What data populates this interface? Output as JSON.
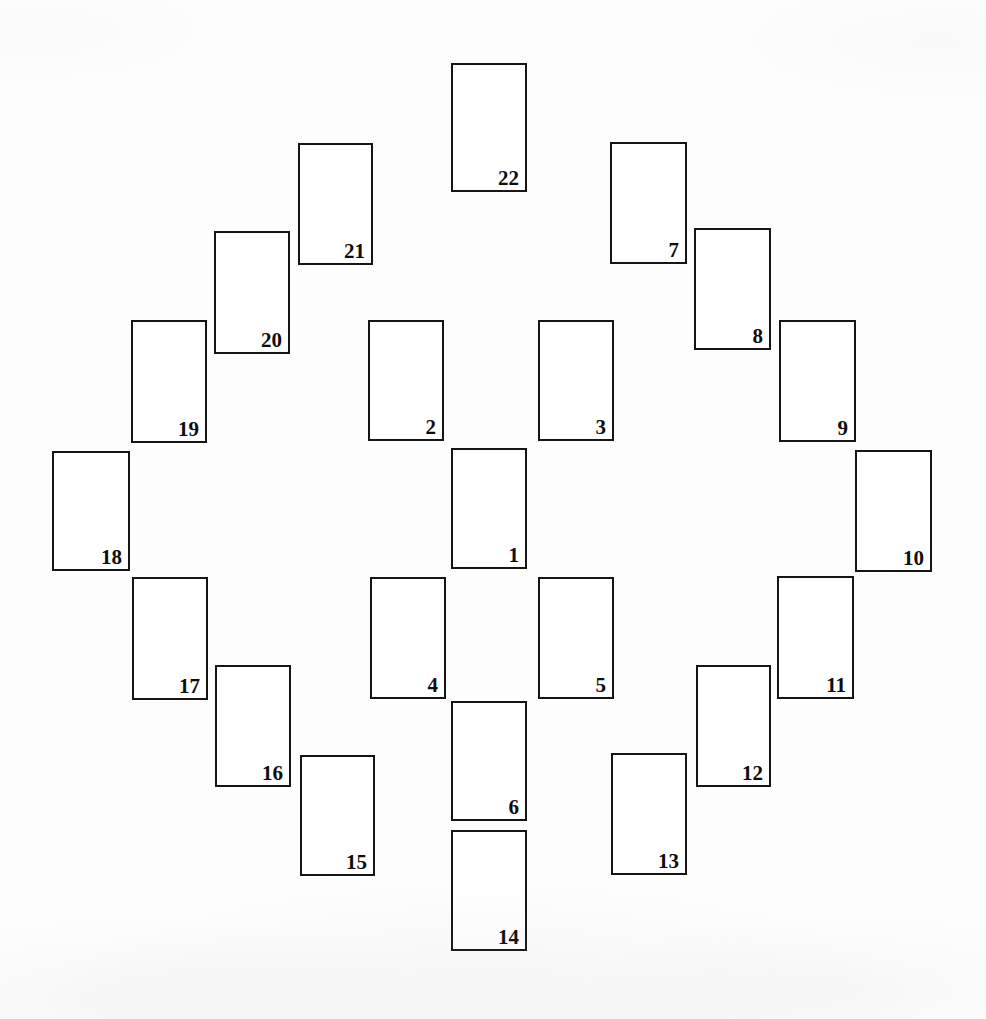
{
  "figure": {
    "type": "rectangle-arrangement-diagram",
    "background_color": "#fdfdfd",
    "stroke_color": "#151515",
    "label_color": "#0d0d0d",
    "canvas": {
      "width": 986,
      "height": 1019
    },
    "card_count": 22
  },
  "cards": [
    {
      "label": "1",
      "x": 451,
      "y": 448,
      "w": 76,
      "h": 121
    },
    {
      "label": "2",
      "x": 368,
      "y": 320,
      "w": 76,
      "h": 121
    },
    {
      "label": "3",
      "x": 538,
      "y": 320,
      "w": 76,
      "h": 121
    },
    {
      "label": "4",
      "x": 370,
      "y": 577,
      "w": 76,
      "h": 122
    },
    {
      "label": "5",
      "x": 538,
      "y": 577,
      "w": 76,
      "h": 122
    },
    {
      "label": "6",
      "x": 451,
      "y": 701,
      "w": 76,
      "h": 120
    },
    {
      "label": "7",
      "x": 610,
      "y": 142,
      "w": 77,
      "h": 122
    },
    {
      "label": "8",
      "x": 694,
      "y": 228,
      "w": 77,
      "h": 122
    },
    {
      "label": "9",
      "x": 779,
      "y": 320,
      "w": 77,
      "h": 122
    },
    {
      "label": "10",
      "x": 855,
      "y": 450,
      "w": 77,
      "h": 122
    },
    {
      "label": "11",
      "x": 777,
      "y": 576,
      "w": 77,
      "h": 123
    },
    {
      "label": "12",
      "x": 696,
      "y": 665,
      "w": 75,
      "h": 122
    },
    {
      "label": "13",
      "x": 611,
      "y": 753,
      "w": 76,
      "h": 122
    },
    {
      "label": "14",
      "x": 451,
      "y": 830,
      "w": 76,
      "h": 121
    },
    {
      "label": "15",
      "x": 300,
      "y": 755,
      "w": 75,
      "h": 121
    },
    {
      "label": "16",
      "x": 215,
      "y": 665,
      "w": 76,
      "h": 122
    },
    {
      "label": "17",
      "x": 132,
      "y": 577,
      "w": 76,
      "h": 123
    },
    {
      "label": "18",
      "x": 52,
      "y": 451,
      "w": 78,
      "h": 120
    },
    {
      "label": "19",
      "x": 131,
      "y": 320,
      "w": 76,
      "h": 123
    },
    {
      "label": "20",
      "x": 214,
      "y": 231,
      "w": 76,
      "h": 123
    },
    {
      "label": "21",
      "x": 298,
      "y": 143,
      "w": 75,
      "h": 122
    },
    {
      "label": "22",
      "x": 451,
      "y": 63,
      "w": 76,
      "h": 129
    }
  ]
}
